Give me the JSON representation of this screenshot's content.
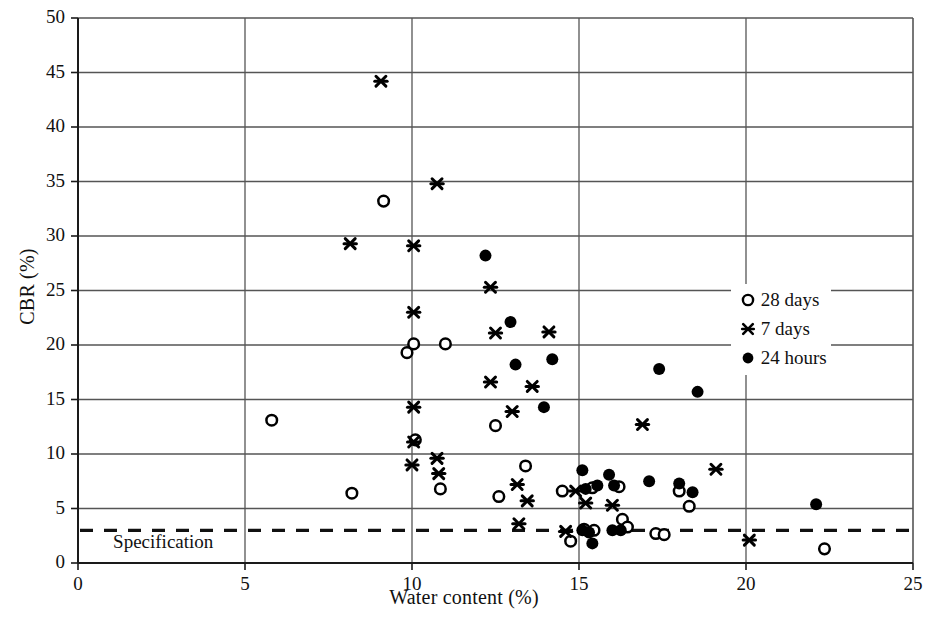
{
  "chart_data": {
    "type": "scatter",
    "title": "",
    "xlabel": "Water content (%)",
    "ylabel": "CBR (%)",
    "xlim": [
      0,
      25
    ],
    "ylim": [
      0,
      50
    ],
    "xticks": [
      0,
      5,
      10,
      15,
      20,
      25
    ],
    "yticks": [
      0,
      5,
      10,
      15,
      20,
      25,
      30,
      35,
      40,
      45,
      50
    ],
    "xtick_labels": [
      "0",
      "5",
      "10",
      "15",
      "20",
      "25"
    ],
    "ytick_labels": [
      "0",
      "5",
      "10",
      "15",
      "20",
      "25",
      "30",
      "35",
      "40",
      "45",
      "50"
    ],
    "grid": "horizontal-and-vertical",
    "grid_color": "#555555",
    "legend_position": "top-right",
    "legend": [
      {
        "label": "28 days",
        "marker": "open-circle"
      },
      {
        "label": "7 days",
        "marker": "star-cross"
      },
      {
        "label": "24 hours",
        "marker": "filled-circle"
      }
    ],
    "annotations": [
      {
        "name": "specification-line",
        "type": "hline",
        "y": 3.0,
        "style": "dashed",
        "label": "Specification",
        "label_x": 1.05,
        "label_y": 1.7
      }
    ],
    "series": [
      {
        "name": "28 days",
        "marker": "open-circle",
        "color": "#000000",
        "points": [
          [
            5.8,
            13.1
          ],
          [
            8.2,
            6.4
          ],
          [
            9.15,
            33.2
          ],
          [
            9.85,
            19.3
          ],
          [
            10.05,
            20.1
          ],
          [
            10.1,
            11.3
          ],
          [
            10.85,
            6.8
          ],
          [
            11.0,
            20.1
          ],
          [
            12.5,
            12.6
          ],
          [
            12.6,
            6.1
          ],
          [
            13.4,
            8.9
          ],
          [
            14.5,
            6.6
          ],
          [
            14.75,
            2.0
          ],
          [
            15.15,
            3.1
          ],
          [
            15.4,
            6.9
          ],
          [
            15.45,
            3.0
          ],
          [
            16.2,
            7.0
          ],
          [
            16.3,
            4.0
          ],
          [
            16.45,
            3.3
          ],
          [
            17.3,
            2.7
          ],
          [
            17.55,
            2.6
          ],
          [
            18.0,
            6.6
          ],
          [
            18.3,
            5.2
          ],
          [
            22.35,
            1.3
          ]
        ]
      },
      {
        "name": "7 days",
        "marker": "star-cross",
        "color": "#000000",
        "points": [
          [
            9.07,
            44.2
          ],
          [
            8.15,
            29.3
          ],
          [
            10.05,
            29.1
          ],
          [
            10.75,
            34.8
          ],
          [
            10.05,
            23.0
          ],
          [
            10.05,
            14.3
          ],
          [
            10.05,
            11.1
          ],
          [
            10.0,
            9.0
          ],
          [
            10.75,
            9.6
          ],
          [
            10.8,
            8.2
          ],
          [
            12.35,
            25.3
          ],
          [
            12.5,
            21.1
          ],
          [
            12.35,
            16.6
          ],
          [
            13.15,
            7.2
          ],
          [
            13.0,
            13.9
          ],
          [
            13.45,
            5.7
          ],
          [
            13.2,
            3.6
          ],
          [
            13.6,
            16.2
          ],
          [
            14.1,
            21.2
          ],
          [
            14.9,
            6.6
          ],
          [
            15.2,
            5.5
          ],
          [
            14.6,
            2.9
          ],
          [
            16.0,
            5.3
          ],
          [
            16.9,
            12.7
          ],
          [
            19.1,
            8.6
          ],
          [
            20.1,
            2.1
          ]
        ]
      },
      {
        "name": "24 hours",
        "marker": "filled-circle",
        "color": "#000000",
        "points": [
          [
            12.2,
            28.2
          ],
          [
            12.95,
            22.1
          ],
          [
            13.1,
            18.2
          ],
          [
            13.95,
            14.3
          ],
          [
            14.2,
            18.7
          ],
          [
            15.1,
            8.5
          ],
          [
            15.2,
            6.8
          ],
          [
            15.1,
            3.0
          ],
          [
            15.3,
            2.8
          ],
          [
            15.4,
            1.8
          ],
          [
            15.55,
            7.1
          ],
          [
            15.9,
            8.1
          ],
          [
            16.05,
            7.1
          ],
          [
            16.0,
            3.0
          ],
          [
            16.25,
            3.0
          ],
          [
            17.1,
            7.5
          ],
          [
            17.4,
            17.8
          ],
          [
            18.0,
            7.3
          ],
          [
            18.55,
            15.7
          ],
          [
            18.4,
            6.5
          ],
          [
            22.1,
            5.4
          ]
        ]
      }
    ]
  }
}
